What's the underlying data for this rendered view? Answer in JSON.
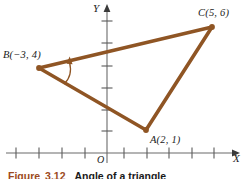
{
  "figure": {
    "caption_figure_word": "Figure",
    "caption_number": "3.12",
    "caption_title": "Angle of a triangle"
  },
  "axes": {
    "x_axis_label": "X",
    "y_axis_label": "Y",
    "origin_label": "O",
    "x_axis_color": "#6b6b6b",
    "y_axis_color": "#6b6b6b",
    "x_tick_count_left": 4,
    "x_tick_count_right": 5,
    "y_tick_count": 6,
    "tick_spacing_px": 22.6,
    "origin_px": {
      "x": 107,
      "y": 153
    }
  },
  "triangle": {
    "stroke_color": "#8f5524",
    "stroke_width": 3.4,
    "vertices": [
      {
        "name": "A",
        "label": "A(2, 1)",
        "x": 2,
        "y": 1,
        "px": {
          "x": 146,
          "y": 130
        }
      },
      {
        "name": "B",
        "label": "B(−3, 4)",
        "x": -3,
        "y": 4,
        "px": {
          "x": 39,
          "y": 68
        }
      },
      {
        "name": "C",
        "label": "C(5, 6)",
        "x": 5,
        "y": 6,
        "px": {
          "x": 212,
          "y": 27
        }
      }
    ],
    "sides": [
      "AB",
      "BC",
      "CA"
    ]
  },
  "angle_marker": {
    "at_vertex": "B",
    "description": "curved arrow sweeping from side BA to side BC",
    "color": "#8f5524"
  },
  "labels": {
    "a_label": "A(2, 1)",
    "b_label": "B(−3, 4)",
    "c_label": "C(5, 6)"
  }
}
